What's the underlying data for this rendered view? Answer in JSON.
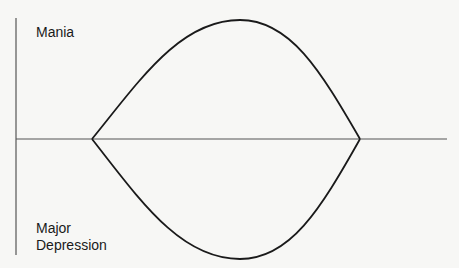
{
  "diagram": {
    "labels": {
      "top": "Mania",
      "bottom_line1": "Major",
      "bottom_line2": "Depression"
    },
    "colors": {
      "background": "#f7f7f5",
      "stroke": "#1a1a1a",
      "axis": "#555555"
    },
    "axes": {
      "vertical": {
        "x": 16,
        "y1": 18,
        "y2": 255
      },
      "horizontal": {
        "y": 139,
        "x1": 16,
        "x2": 447
      }
    },
    "curves": {
      "upper": {
        "start": [
          92,
          139
        ],
        "peak": [
          240,
          20
        ],
        "end": [
          360,
          139
        ],
        "meaning": "manic episode"
      },
      "lower": {
        "start": [
          92,
          139
        ],
        "trough": [
          240,
          259
        ],
        "end": [
          360,
          139
        ],
        "meaning": "depressive episode"
      }
    }
  }
}
